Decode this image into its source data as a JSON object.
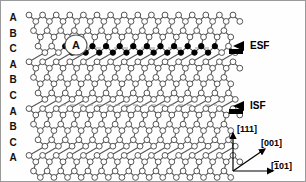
{
  "figure": {
    "type": "crystal-lattice-stacking-fault-diagram",
    "background": "#fefefe",
    "frame_color": "#9a9a9a",
    "atom_open_fill": "#ffffff",
    "atom_filled_fill": "#000000",
    "bond_color": "#555555",
    "dashed_color": "#9a9a9a"
  },
  "stacking_labels": {
    "name": "ABC stacking sequence",
    "items": [
      "A",
      "B",
      "C",
      "A",
      "B",
      "C",
      "A",
      "B",
      "C",
      "A"
    ]
  },
  "annotations": {
    "esf": {
      "label": "ESF",
      "meaning": "extrinsic stacking fault",
      "arrow": "left-pointing-arrow"
    },
    "isf": {
      "label": "ISF",
      "meaning": "intrinsic stacking fault",
      "arrow": "left-pointing-arrow"
    },
    "inline_plane_label": "A"
  },
  "axes": {
    "vertical": {
      "label": "[111]",
      "bar_digits": []
    },
    "diagonal": {
      "label": "[001]",
      "bar_digits": []
    },
    "horizontal": {
      "label_prefix": "[",
      "bar_digit": "1",
      "label_suffix": "01]"
    }
  },
  "lattice": {
    "rows": 10,
    "columns": 16,
    "esf_row_index": 2,
    "isf_row_index": 6
  }
}
